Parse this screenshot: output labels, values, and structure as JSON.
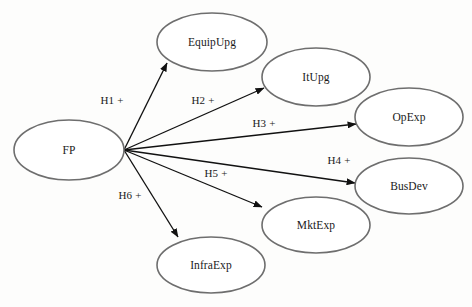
{
  "diagram": {
    "type": "path-diagram",
    "background_color": "#fdfdfc",
    "node_stroke_color": "#6e6e6e",
    "arrow_color": "#111111",
    "text_color": "#1a1a1a",
    "source_node": "FP",
    "fan_origin": {
      "x": 124,
      "y": 150
    },
    "nodes": [
      {
        "id": "fp",
        "label": "FP",
        "cx": 69,
        "cy": 150,
        "rx": 55,
        "ry": 30
      },
      {
        "id": "equipupg",
        "label": "EquipUpg",
        "cx": 212,
        "cy": 42,
        "rx": 55,
        "ry": 29
      },
      {
        "id": "itupg",
        "label": "ItUpg",
        "cx": 316,
        "cy": 77,
        "rx": 54,
        "ry": 29
      },
      {
        "id": "opexp",
        "label": "OpExp",
        "cx": 409,
        "cy": 117,
        "rx": 54,
        "ry": 29
      },
      {
        "id": "busdev",
        "label": "BusDev",
        "cx": 409,
        "cy": 186,
        "rx": 54,
        "ry": 28
      },
      {
        "id": "mktexp",
        "label": "MktExp",
        "cx": 316,
        "cy": 225,
        "rx": 54,
        "ry": 28
      },
      {
        "id": "infraexp",
        "label": "InfraExp",
        "cx": 211,
        "cy": 265,
        "rx": 54,
        "ry": 28
      }
    ],
    "paths": [
      {
        "id": "h1",
        "label": "H1 +",
        "from": "fp",
        "to": "equipupg",
        "x1": 124,
        "y1": 150,
        "x2": 167,
        "y2": 63,
        "label_x": 112,
        "label_y": 101
      },
      {
        "id": "h2",
        "label": "H2 +",
        "from": "fp",
        "to": "itupg",
        "x1": 124,
        "y1": 150,
        "x2": 264,
        "y2": 88,
        "label_x": 203,
        "label_y": 101
      },
      {
        "id": "h3",
        "label": "H3 +",
        "from": "fp",
        "to": "opexp",
        "x1": 124,
        "y1": 150,
        "x2": 356,
        "y2": 124,
        "label_x": 264,
        "label_y": 124
      },
      {
        "id": "h4",
        "label": "H4 +",
        "from": "fp",
        "to": "busdev",
        "x1": 124,
        "y1": 150,
        "x2": 355,
        "y2": 183,
        "label_x": 339,
        "label_y": 161
      },
      {
        "id": "h5",
        "label": "H5 +",
        "from": "fp",
        "to": "mktexp",
        "x1": 124,
        "y1": 150,
        "x2": 262,
        "y2": 207,
        "label_x": 216,
        "label_y": 174
      },
      {
        "id": "h6",
        "label": "H6 +",
        "from": "fp",
        "to": "infraexp",
        "x1": 124,
        "y1": 150,
        "x2": 178,
        "y2": 237,
        "label_x": 130,
        "label_y": 196
      }
    ]
  }
}
